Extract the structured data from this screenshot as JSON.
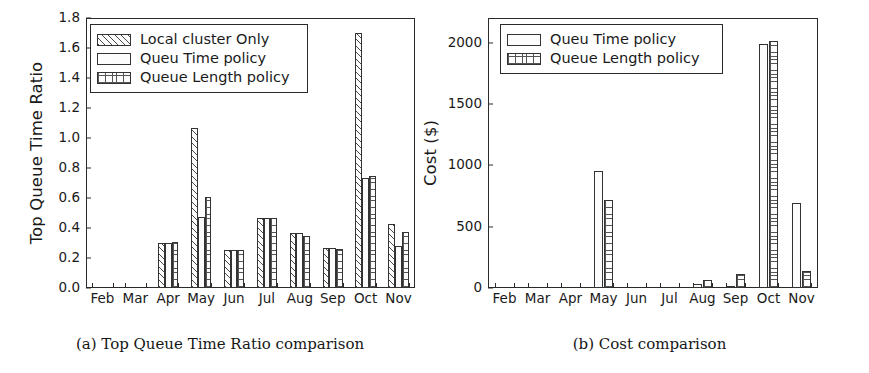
{
  "figure": {
    "subfigures": [
      {
        "tag": "(a)",
        "caption": "(a) Top Queue Time Ratio comparison"
      },
      {
        "tag": "(b)",
        "caption": "(b) Cost comparison"
      }
    ]
  },
  "chart_data": [
    {
      "type": "bar",
      "title": "",
      "subfigure_label": "(a)",
      "caption": "(a) Top Queue Time Ratio comparison",
      "xlabel": "",
      "ylabel": "Top Queue Time Ratio",
      "ylim": [
        0.0,
        1.8
      ],
      "yticks": [
        "0.0",
        "0.2",
        "0.4",
        "0.6",
        "0.8",
        "1.0",
        "1.2",
        "1.4",
        "1.6",
        "1.8"
      ],
      "ytick_values": [
        0.0,
        0.2,
        0.4,
        0.6,
        0.8,
        1.0,
        1.2,
        1.4,
        1.6,
        1.8
      ],
      "grid": false,
      "legend_position": "upper left",
      "categories": [
        "Feb",
        "Mar",
        "Apr",
        "May",
        "Jun",
        "Jul",
        "Aug",
        "Sep",
        "Oct",
        "Nov"
      ],
      "series": [
        {
          "name": "Local cluster Only",
          "pattern": "diagonal-hatch",
          "values": [
            0,
            0,
            0.3,
            1.07,
            0.255,
            0.47,
            0.37,
            0.265,
            1.7,
            0.425
          ]
        },
        {
          "name": "Queu Time policy",
          "pattern": "dots",
          "values": [
            0,
            0,
            0.3,
            0.475,
            0.255,
            0.47,
            0.365,
            0.265,
            0.735,
            0.28
          ]
        },
        {
          "name": "Queue Length policy",
          "pattern": "grid",
          "values": [
            0,
            0,
            0.305,
            0.61,
            0.255,
            0.47,
            0.35,
            0.26,
            0.745,
            0.375
          ]
        }
      ]
    },
    {
      "type": "bar",
      "title": "",
      "subfigure_label": "(b)",
      "caption": "(b) Cost comparison",
      "xlabel": "",
      "ylabel": "Cost ($)",
      "ylim": [
        0,
        2200
      ],
      "yticks": [
        "0",
        "500",
        "1000",
        "1500",
        "2000"
      ],
      "ytick_values": [
        0,
        500,
        1000,
        1500,
        2000
      ],
      "grid": false,
      "legend_position": "upper left",
      "categories": [
        "Feb",
        "Mar",
        "Apr",
        "May",
        "Jun",
        "Jul",
        "Aug",
        "Sep",
        "Oct",
        "Nov"
      ],
      "series": [
        {
          "name": "Queu Time policy",
          "pattern": "dots",
          "values": [
            0,
            0,
            0,
            955,
            0,
            0,
            35,
            15,
            1990,
            690
          ]
        },
        {
          "name": "Queue Length policy",
          "pattern": "grid",
          "values": [
            0,
            0,
            0,
            720,
            0,
            0,
            65,
            115,
            2015,
            135
          ]
        }
      ]
    }
  ]
}
